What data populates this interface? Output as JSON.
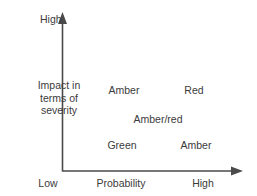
{
  "diagram": {
    "type": "risk-matrix",
    "axes": {
      "y": {
        "title_lines": [
          "Impact in",
          "terms of",
          "severity"
        ],
        "high_label": "High",
        "arrow": "up-arrow-icon"
      },
      "x": {
        "title": "Probability",
        "low_label": "Low",
        "high_label": "High",
        "arrow": "right-arrow-icon"
      }
    },
    "cells": [
      {
        "id": "amber-top",
        "label": "Amber",
        "probability": "low",
        "impact": "high"
      },
      {
        "id": "red",
        "label": "Red",
        "probability": "high",
        "impact": "high"
      },
      {
        "id": "amber-red",
        "label": "Amber/red",
        "probability": "medium",
        "impact": "medium"
      },
      {
        "id": "green",
        "label": "Green",
        "probability": "low",
        "impact": "low"
      },
      {
        "id": "amber-low",
        "label": "Amber",
        "probability": "high",
        "impact": "low"
      }
    ],
    "colors": {
      "axis": "#4a4a4a",
      "text": "#3b3b3b",
      "background": "#ffffff"
    }
  }
}
